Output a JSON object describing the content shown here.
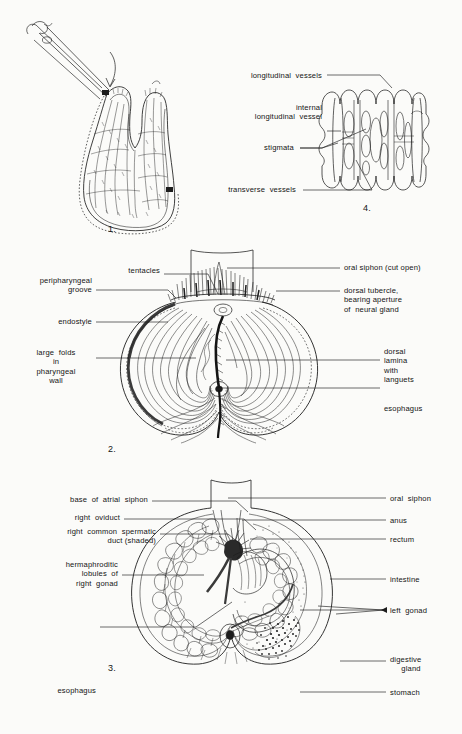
{
  "plate": {
    "title": "Ascidian (sea squirt) dissection plate",
    "background_color": "#fbfbf9",
    "ink_color": "#1d1d1d"
  },
  "figures": [
    {
      "number": "1.",
      "name": "whole-animal-cut-open",
      "caption": "",
      "labels": []
    },
    {
      "number": "4.",
      "name": "pharyngeal-wall-detail",
      "labels": [
        {
          "text": "longitudinal  vessels",
          "align": "right"
        },
        {
          "text": "internal\n   longitudinal  vessel",
          "align": "right"
        },
        {
          "text": "stigmata",
          "align": "right"
        },
        {
          "text": "transverse  vessels",
          "align": "right"
        }
      ]
    },
    {
      "number": "2.",
      "name": "pharynx-opened",
      "labels_left": [
        {
          "text": "tentacles"
        },
        {
          "text": "peripharyngeal\n          groove"
        },
        {
          "text": "endostyle"
        },
        {
          "text": "large  folds\nin\npharyngeal\nwall"
        }
      ],
      "labels_right": [
        {
          "text": "oral siphon (cut open)"
        },
        {
          "text": "dorsal tubercle,\nbearing aperture\nof  neural gland"
        },
        {
          "text": "dorsal\nlamina\nwith\nlanguets"
        },
        {
          "text": "esophagus"
        }
      ]
    },
    {
      "number": "3.",
      "name": "viscera-and-gonads",
      "labels_left": [
        {
          "text": "base  of  atrial  siphon"
        },
        {
          "text": "right  oviduct"
        },
        {
          "text": "right  common  spermatic\n   duct (shaded)"
        },
        {
          "text": "hermaphroditic\n    lobules  of\nright  gonad"
        },
        {
          "text": "esophagus"
        }
      ],
      "labels_right": [
        {
          "text": "oral  siphon"
        },
        {
          "text": "anus"
        },
        {
          "text": "rectum"
        },
        {
          "text": "intestine"
        },
        {
          "text": "left  gonad"
        },
        {
          "text": "digestive\n     gland"
        },
        {
          "text": "stomach"
        }
      ]
    }
  ]
}
